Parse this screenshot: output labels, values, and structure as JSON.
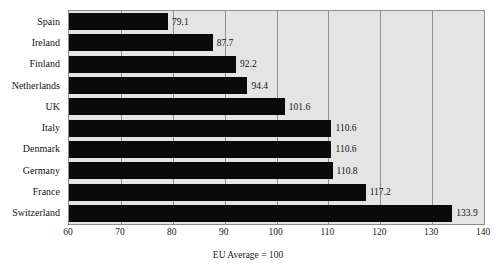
{
  "figure": {
    "title_remnant": "Figure 1.1  Gross domestic product per head of population, 2004",
    "x_axis_title": "EU Average = 100"
  },
  "chart_data": {
    "type": "bar",
    "orientation": "horizontal",
    "title": "",
    "xlabel": "EU Average = 100",
    "ylabel": "",
    "xlim": [
      60,
      140
    ],
    "xticks": [
      60,
      70,
      80,
      90,
      100,
      110,
      120,
      130,
      140
    ],
    "grid": true,
    "legend": "none",
    "bar_color": "#0a0a0a",
    "plot_background": "#e4e4e4",
    "categories": [
      "Spain",
      "Ireland",
      "Finland",
      "Netherlands",
      "UK",
      "Italy",
      "Denmark",
      "Germany",
      "France",
      "Switzerland"
    ],
    "values": [
      79.1,
      87.7,
      92.2,
      94.4,
      101.6,
      110.6,
      110.6,
      110.8,
      117.2,
      133.9
    ],
    "value_labels": [
      "79.1",
      "87.7",
      "92.2",
      "94.4",
      "101.6",
      "110.6",
      "110.6",
      "110.8",
      "117.2",
      "133.9"
    ]
  }
}
